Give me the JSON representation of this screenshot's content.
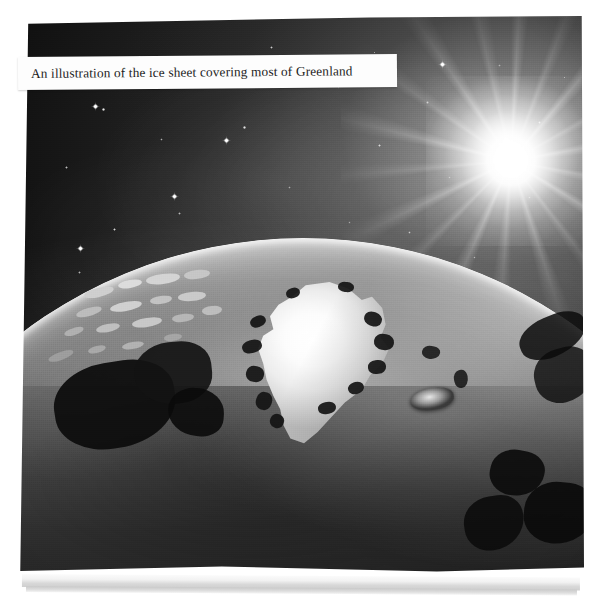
{
  "page": {
    "type": "scanned-book-page",
    "background_color": "#ffffff",
    "photo": {
      "name": "greenland-ice-sheet-from-space",
      "rendering": "grayscale",
      "subject": "Earth seen from orbit with the Greenland ice sheet and the Sun rising beyond the limb",
      "alt_text": "Black and white view of Earth from space showing the bright white Greenland ice sheet, the Canadian Arctic archipelago, Iceland and the curved horizon of the planet, with the Sun flaring above the limb",
      "elements": {
        "sun": "sun-starburst",
        "starfield": "stars",
        "earth": "earth-limb",
        "ice_sheet": "greenland-ice-sheet",
        "archipelago": "canadian-arctic-archipelago",
        "iceland": "iceland-island",
        "scandinavia": "scandinavia-landmass"
      },
      "colors": {
        "space": "#000000",
        "sun_core": "#ffffff",
        "ice": "#ffffff",
        "ocean": "#2a2a2a",
        "limb_glow": "#d0d0d0"
      }
    }
  },
  "caption": {
    "text": "An illustration of the ice sheet covering most of Greenland",
    "background_color": "#fdfdfd",
    "text_color": "#1c1c1c"
  }
}
